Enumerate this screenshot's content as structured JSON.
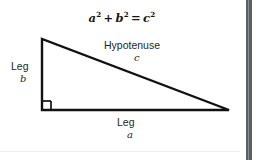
{
  "page": {
    "background_color": "#ffffff",
    "content_width_px": 244
  },
  "scrollbar": {
    "present": true,
    "color": "#5c5f61",
    "highlight_color": "#8d9093",
    "orientation": "vertical",
    "position": "right"
  },
  "diagram": {
    "type": "right-triangle",
    "stroke_color": "#111111",
    "stroke_width": 2.4,
    "fill": "none",
    "vertices": {
      "top_left": {
        "x": 42,
        "y": 39
      },
      "bottom_left": {
        "x": 42,
        "y": 110
      },
      "bottom_right": {
        "x": 229,
        "y": 110
      }
    },
    "right_angle_marker": {
      "at": "bottom_left",
      "size_px": 9,
      "shape": "square"
    },
    "equation": {
      "base_a": "a",
      "exp_a": "2",
      "plus": "+",
      "base_b": "b",
      "exp_b": "2",
      "equals": "=",
      "base_c": "c",
      "exp_c": "2",
      "plain_text": "a² + b² = c²"
    },
    "labels": {
      "hypotenuse_word": "Hypotenuse",
      "hypotenuse_var": "c",
      "leg_vertical_word": "Leg",
      "leg_vertical_var": "b",
      "leg_horizontal_word": "Leg",
      "leg_horizontal_var": "a"
    }
  }
}
